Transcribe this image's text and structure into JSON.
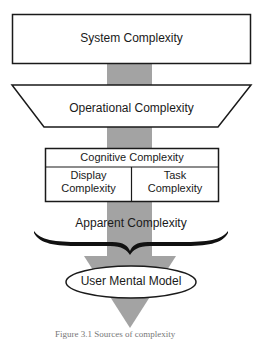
{
  "diagram": {
    "colors": {
      "flow_bar": "#a3a3a3",
      "stroke": "#1a1a1a",
      "fill": "#ffffff"
    },
    "nodes": {
      "system": {
        "label": "System Complexity",
        "shape": "rectangle"
      },
      "operational": {
        "label": "Operational Complexity",
        "shape": "trapezoid"
      },
      "cognitive": {
        "label": "Cognitive Complexity",
        "shape": "table-box",
        "children": [
          {
            "label_line1": "Display",
            "label_line2": "Complexity"
          },
          {
            "label_line1": "Task",
            "label_line2": "Complexity"
          }
        ]
      },
      "apparent": {
        "label": "Apparent Complexity",
        "shape": "brace"
      },
      "user_model": {
        "label": "User Mental Model",
        "shape": "ellipse"
      }
    },
    "flow": [
      "System Complexity",
      "Operational Complexity",
      "Cognitive Complexity",
      "Apparent Complexity",
      "User Mental Model"
    ],
    "caption": "Figure 3.1 Sources of complexity"
  }
}
